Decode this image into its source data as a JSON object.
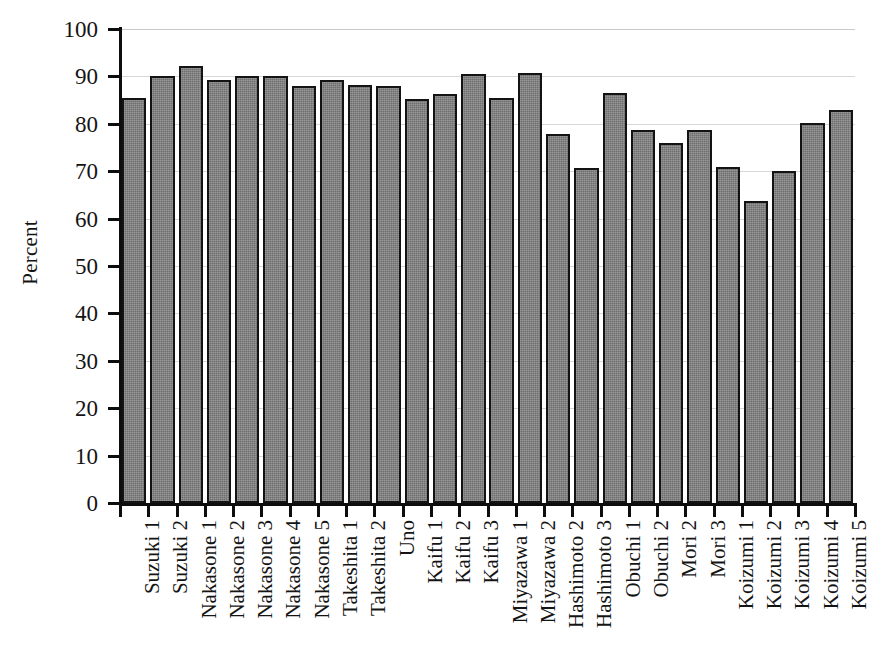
{
  "chart_data": {
    "type": "bar",
    "title": "",
    "subtitle": "",
    "xlabel": "",
    "ylabel": "Percent",
    "ylim": [
      0,
      100
    ],
    "yticks": [
      0,
      10,
      20,
      30,
      40,
      50,
      60,
      70,
      80,
      90,
      100
    ],
    "ytick_labels": [
      "0",
      "10",
      "20",
      "30",
      "40",
      "50",
      "60",
      "70",
      "80",
      "90",
      "100"
    ],
    "grid": "horizontal",
    "legend": "none",
    "bar_color": "#6e6e6e",
    "bar_edge_color": "#131313",
    "categories": [
      "Suzuki 1",
      "Suzuki 2",
      "Nakasone 1",
      "Nakasone 2",
      "Nakasone 3",
      "Nakasone 4",
      "Nakasone 5",
      "Takeshita 1",
      "Takeshita 2",
      "Uno",
      "Kaifu 1",
      "Kaifu 2",
      "Kaifu 3",
      "Miyazawa 1",
      "Miyazawa 2",
      "Hashimoto 2",
      "Hashimoto 3",
      "Obuchi 1",
      "Obuchi 2",
      "Mori 2",
      "Mori 3",
      "Koizumi 1",
      "Koizumi 2",
      "Koizumi 3",
      "Koizumi 4",
      "Koizumi 5"
    ],
    "values": [
      85.5,
      90.0,
      92.1,
      89.3,
      90.0,
      90.0,
      88.0,
      89.2,
      88.1,
      88.0,
      85.2,
      86.3,
      90.5,
      85.4,
      90.8,
      77.8,
      70.7,
      86.6,
      78.8,
      76.0,
      78.8,
      70.9,
      63.7,
      70.1,
      80.1,
      83.0
    ]
  }
}
